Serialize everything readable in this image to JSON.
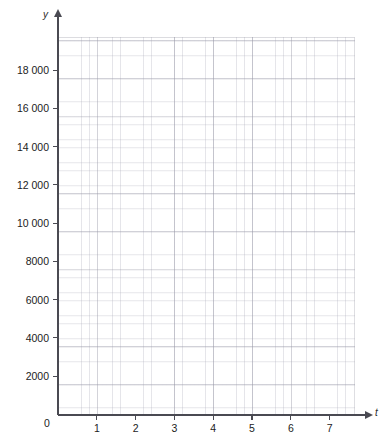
{
  "chart_data": {
    "type": "line",
    "title": "",
    "subtitle": "",
    "xlabel": "t",
    "ylabel": "y",
    "grid": true,
    "grid_style": "graph-paper",
    "minor_divisions_per_major_x": 5,
    "minor_divisions_per_major_y": 5,
    "legend": null,
    "series": [],
    "annotations": [],
    "xlim": [
      0,
      7.65
    ],
    "ylim": [
      0,
      19800
    ],
    "x_ticks": [
      0,
      1,
      2,
      3,
      4,
      5,
      6,
      7
    ],
    "x_tick_labels": [
      "0",
      "1",
      "2",
      "3",
      "4",
      "5",
      "6",
      "7"
    ],
    "y_ticks": [
      0,
      2000,
      4000,
      6000,
      8000,
      10000,
      12000,
      14000,
      16000,
      18000
    ],
    "y_tick_labels": [
      "0",
      "2000",
      "4000",
      "6000",
      "8000",
      "10 000",
      "12 000",
      "14 000",
      "16 000",
      "18 000"
    ]
  },
  "axes": {
    "y_axis_label": "y",
    "x_axis_label": "t",
    "origin_label": "0"
  },
  "colors": {
    "axis": "#4a4a52",
    "grid_major": "#9696a5",
    "grid_minor": "#aaaab9",
    "text": "#1c1c1c",
    "background": "#ffffff"
  }
}
